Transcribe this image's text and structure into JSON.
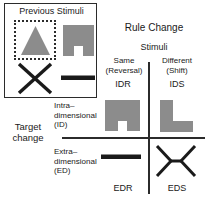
{
  "previous_stimuli": {
    "title": "Previous Stimuli",
    "target_shape_name": "triangle",
    "distractor_shape_name": "notched-square",
    "bottom_left_shape_name": "x-cross",
    "bottom_right_shape_name": "horizontal-bar",
    "target_marker": "dotted-selection-box"
  },
  "column_axis": {
    "heading": "Rule Change",
    "subheading": "Stimuli",
    "columns": [
      {
        "line1": "Same",
        "line2": "(Reversal)",
        "code": "IDR"
      },
      {
        "line1": "Different",
        "line2": "(Shift)",
        "code": "IDS"
      }
    ]
  },
  "row_axis": {
    "heading_line1": "Target",
    "heading_line2": "change",
    "rows": [
      {
        "line1": "Intra–",
        "line2": "dimensional",
        "line3": "(ID)"
      },
      {
        "line1": "Extra–",
        "line2": "dimensional",
        "line3": "(ED)"
      }
    ]
  },
  "cells": {
    "idr": {
      "code": "IDR",
      "shape_name": "notched-square",
      "fill": "#8c8c8c"
    },
    "ids": {
      "code": "IDS",
      "shape_name": "l-shape",
      "fill": "#8c8c8c"
    },
    "edr": {
      "code": "EDR",
      "shape_name": "horizontal-bar",
      "fill": "#1a1a1a"
    },
    "eds": {
      "code": "EDS",
      "shape_name": "bowtie-cross",
      "fill": "#1a1a1a"
    }
  },
  "colors": {
    "shape_gray": "#8c8c8c",
    "line_black": "#1a1a1a",
    "border": "#2b2b2b",
    "background": "#ffffff"
  }
}
